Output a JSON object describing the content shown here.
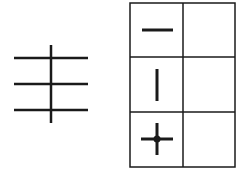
{
  "diagram": {
    "left_figure": {
      "horizontal_lines": 3,
      "vertical_lines": 1
    },
    "table": {
      "rows": 3,
      "columns": 2,
      "cells": [
        [
          "horizontal-stroke",
          ""
        ],
        [
          "vertical-stroke",
          ""
        ],
        [
          "cross-with-dot",
          ""
        ]
      ]
    },
    "colors": {
      "stroke": "#1a1a1a",
      "background": "#ffffff"
    }
  }
}
